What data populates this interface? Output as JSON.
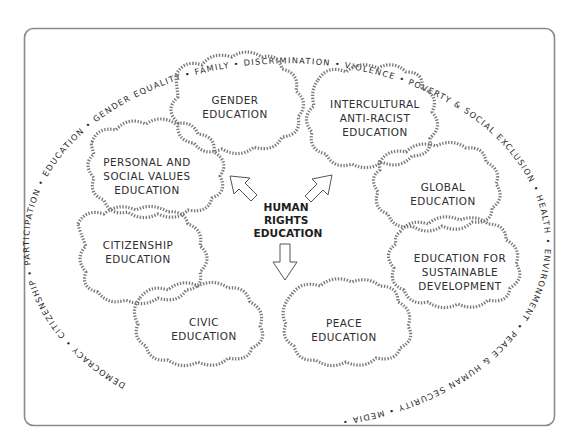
{
  "diagram": {
    "center": {
      "lines": [
        "HUMAN",
        "RIGHTS",
        "EDUCATION"
      ]
    },
    "clouds": [
      {
        "id": "gender",
        "lines": [
          "GENDER",
          "EDUCATION"
        ]
      },
      {
        "id": "intercultural",
        "lines": [
          "INTERCULTURAL",
          "ANTI-RACIST",
          "EDUCATION"
        ]
      },
      {
        "id": "personal",
        "lines": [
          "PERSONAL AND",
          "SOCIAL VALUES",
          "EDUCATION"
        ]
      },
      {
        "id": "global",
        "lines": [
          "GLOBAL",
          "EDUCATION"
        ]
      },
      {
        "id": "citizenship",
        "lines": [
          "CITIZENSHIP",
          "EDUCATION"
        ]
      },
      {
        "id": "sustainable",
        "lines": [
          "EDUCATION FOR",
          "SUSTAINABLE",
          "DEVELOPMENT"
        ]
      },
      {
        "id": "civic",
        "lines": [
          "CIVIC",
          "EDUCATION"
        ]
      },
      {
        "id": "peace",
        "lines": [
          "PEACE",
          "EDUCATION"
        ]
      }
    ],
    "ring_text": "DEMOCRACY • CITIZENSHIP • PARTICIPATION • EDUCATION • GENDER EQUALITY • FAMILY • DISCRIMINATION • VIOLENCE • POVERTY & SOCIAL EXCLUSION • HEALTH • ENVIRONMENT • PEACE & HUMAN SECURITY • MEDIA •",
    "ring_terms": [
      "DEMOCRACY",
      "CITIZENSHIP",
      "PARTICIPATION",
      "EDUCATION",
      "GENDER EQUALITY",
      "FAMILY",
      "DISCRIMINATION",
      "VIOLENCE",
      "POVERTY & SOCIAL EXCLUSION",
      "HEALTH",
      "ENVIRONMENT",
      "PEACE & HUMAN SECURITY",
      "MEDIA"
    ],
    "arrows": [
      "arrow-up-left",
      "arrow-up-right",
      "arrow-down"
    ],
    "colors": {
      "frame": "#8a8a8a",
      "cloud_stroke": "#7a7a7a",
      "text": "#2e2e2e"
    }
  }
}
